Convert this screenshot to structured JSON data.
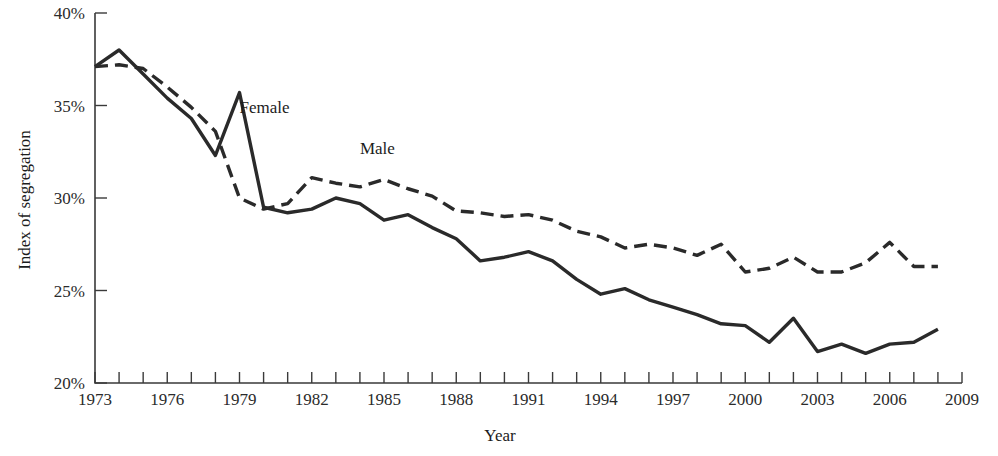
{
  "chart_data": {
    "type": "line",
    "title": "",
    "xlabel": "Year",
    "ylabel": "Index of segregation",
    "xlim": [
      1973,
      2009
    ],
    "ylim": [
      20,
      40
    ],
    "ytick_labels": [
      "40%",
      "35%",
      "30%",
      "25%",
      "20%"
    ],
    "ytick_values": [
      40,
      35,
      30,
      25,
      20
    ],
    "xtick_labels": [
      "1973",
      "1976",
      "1979",
      "1982",
      "1985",
      "1988",
      "1991",
      "1994",
      "1997",
      "2000",
      "2003",
      "2006",
      "2009"
    ],
    "xtick_values": [
      1973,
      1976,
      1979,
      1982,
      1985,
      1988,
      1991,
      1994,
      1997,
      2000,
      2003,
      2006,
      2009
    ],
    "xtick_minor_step": 1,
    "grid": false,
    "legend_position": "inline-annotation",
    "x": [
      1973,
      1974,
      1975,
      1976,
      1977,
      1978,
      1979,
      1980,
      1981,
      1982,
      1983,
      1984,
      1985,
      1986,
      1987,
      1988,
      1989,
      1990,
      1991,
      1992,
      1993,
      1994,
      1995,
      1996,
      1997,
      1998,
      1999,
      2000,
      2001,
      2002,
      2003,
      2004,
      2005,
      2006,
      2007,
      2008
    ],
    "series": [
      {
        "name": "Female",
        "style": "dashed",
        "annotation": "Female",
        "values": [
          37.1,
          37.2,
          37.0,
          36.0,
          34.9,
          33.6,
          30.0,
          29.4,
          29.7,
          31.1,
          30.8,
          30.6,
          31.0,
          30.5,
          30.1,
          29.3,
          29.2,
          29.0,
          29.1,
          28.8,
          28.2,
          27.9,
          27.3,
          27.5,
          27.3,
          26.9,
          27.5,
          26.0,
          26.2,
          26.8,
          26.0,
          26.0,
          26.5,
          27.6,
          26.3,
          26.3
        ]
      },
      {
        "name": "Male",
        "style": "solid",
        "annotation": "Male",
        "values": [
          37.1,
          38.0,
          36.7,
          35.4,
          34.3,
          32.3,
          35.7,
          29.5,
          29.2,
          29.4,
          30.0,
          29.7,
          28.8,
          29.1,
          28.4,
          27.8,
          26.6,
          26.8,
          27.1,
          26.6,
          25.6,
          24.8,
          25.1,
          24.5,
          24.1,
          23.7,
          23.2,
          23.1,
          22.2,
          23.5,
          21.7,
          22.1,
          21.6,
          22.1,
          22.2,
          22.9
        ]
      }
    ],
    "annotations": [
      {
        "text": "Female",
        "x": 1979.0,
        "y": 34.6
      },
      {
        "text": "Male",
        "x": 1984.0,
        "y": 32.4
      }
    ]
  }
}
